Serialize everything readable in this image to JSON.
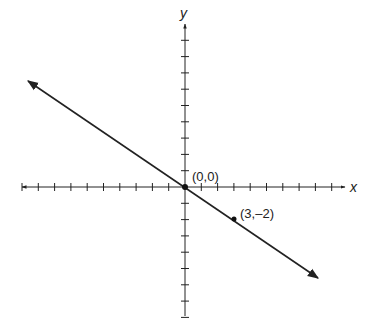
{
  "diagram": {
    "type": "coordinate-plane-line",
    "axes": {
      "x_label": "x",
      "y_label": "y",
      "x_ticks_left": 10,
      "x_ticks_right": 9,
      "y_ticks_up": 9,
      "y_ticks_down": 8
    },
    "line": {
      "slope": "-2/3",
      "equation": "y = -2/3 x"
    },
    "points": [
      {
        "label": "(0,0)",
        "x": 0,
        "y": 0
      },
      {
        "label": "(3,–2)",
        "x": 3,
        "y": -2
      }
    ],
    "colors": {
      "stroke": "#222222",
      "background": "#ffffff"
    }
  }
}
